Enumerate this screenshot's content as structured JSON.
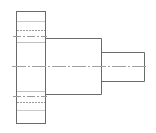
{
  "drawing": {
    "type": "orthographic-view",
    "subject": "stepped shaft with flange",
    "colors": {
      "background": "#ffffff",
      "outline": "#6a6a6a",
      "hidden_line": "#9a9a9a",
      "center_line": "#a0a0a0"
    },
    "parts": [
      {
        "name": "flange",
        "x": 16,
        "y": 11,
        "width": 29,
        "height": 113
      },
      {
        "name": "middle-cylinder",
        "x": 45,
        "y": 38,
        "width": 56,
        "height": 57
      },
      {
        "name": "end-shaft",
        "x": 101,
        "y": 52,
        "width": 43,
        "height": 29
      }
    ],
    "center_line_y": 66
  }
}
